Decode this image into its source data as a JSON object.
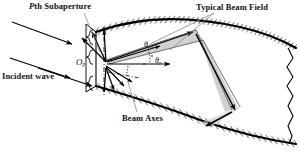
{
  "figure": {
    "type": "technical-diagram",
    "background_color": "#ffffff",
    "line_color": "#000000",
    "beam_fill_color": "#c9c9c9",
    "hatch_color": "#555555"
  },
  "labels": {
    "pth_subaperture": {
      "italic_prefix": "P",
      "text": "th Subaperture"
    },
    "typical_beam_field": "Typical Beam Field",
    "incident_wave": "Incident wave",
    "beam_axes": "Beam Axes"
  },
  "math_labels": {
    "origin": {
      "base": "O",
      "sub": "p"
    },
    "theta_pm": {
      "base": "θ",
      "sub": "pm"
    },
    "theta_p": {
      "base": "θ",
      "sub": "p"
    }
  }
}
